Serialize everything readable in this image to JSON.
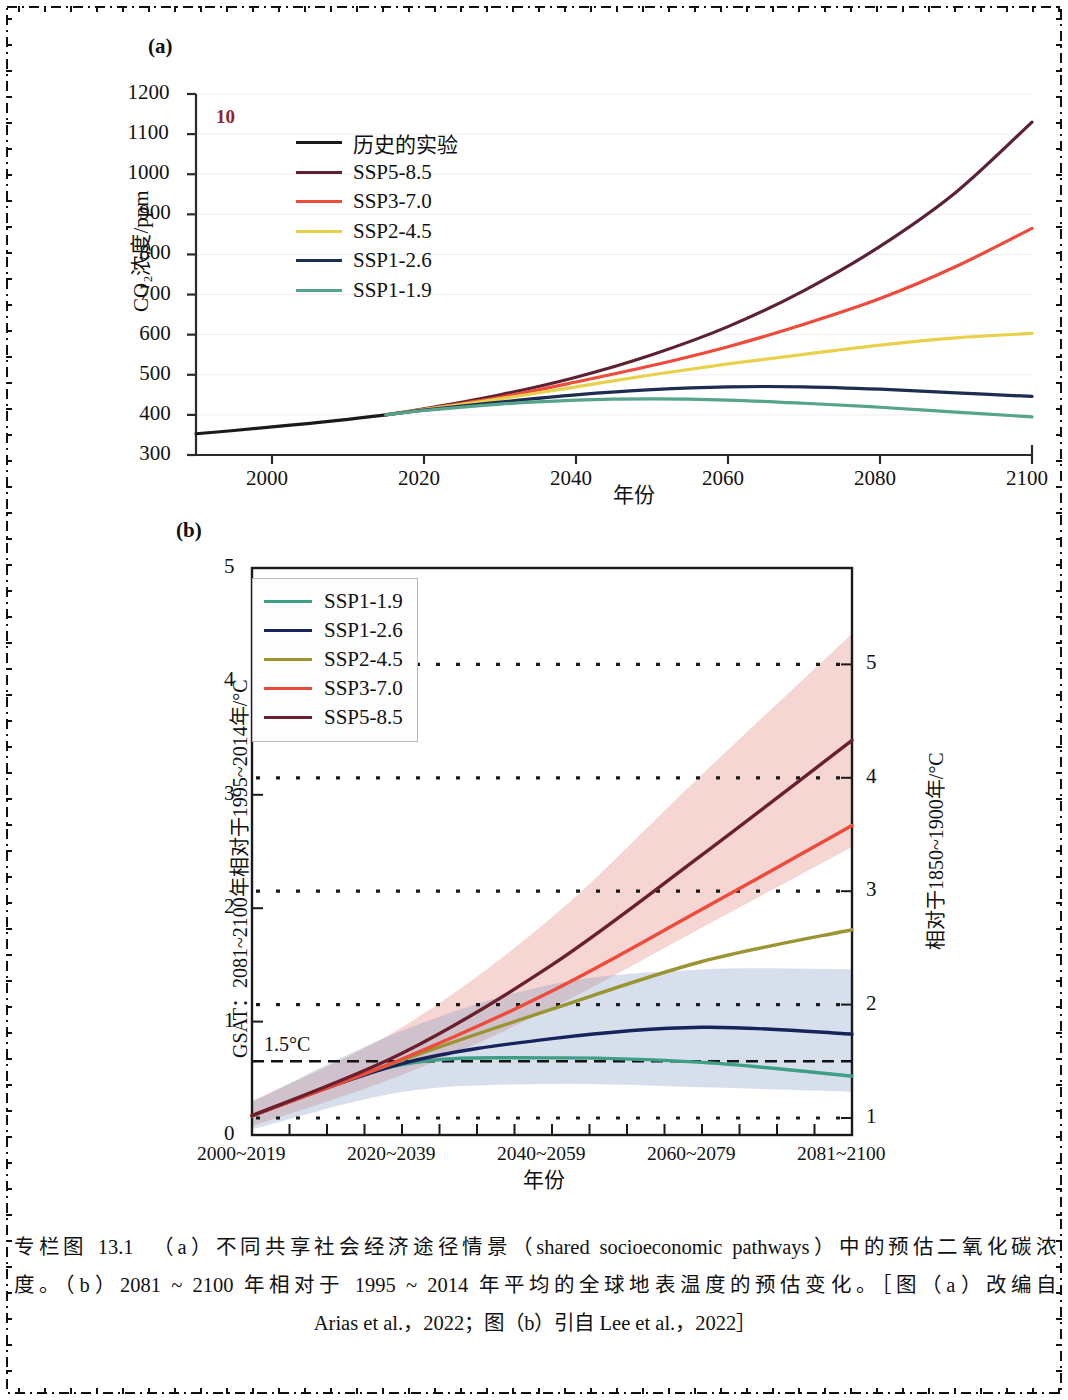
{
  "page": {
    "number": "10",
    "number_color": "#8e2231",
    "frame_style": "dash-dot-cross"
  },
  "panels": [
    {
      "letter": "(a)",
      "ylabel": "CO₂浓度/ppm",
      "xlabel": "年份",
      "legend": [
        {
          "label": "历史的实验",
          "color": "#1a1a1a"
        },
        {
          "label": "SSP5-8.5",
          "color": "#5c2232"
        },
        {
          "label": "SSP3-7.0",
          "color": "#ee4b3a"
        },
        {
          "label": "SSP2-4.5",
          "color": "#e8d14a"
        },
        {
          "label": "SSP1-2.6",
          "color": "#1d2d52"
        },
        {
          "label": "SSP1-1.9",
          "color": "#56a48c"
        }
      ]
    },
    {
      "letter": "(b)",
      "ylabel_left": "GSAT：2081~2100年相对于1995~2014年/°C",
      "ylabel_right": "相对于1850~1900年/°C",
      "xlabel": "年份",
      "threshold_label": "1.5°C",
      "legend": [
        {
          "label": "SSP1-1.9",
          "color": "#3e9e86"
        },
        {
          "label": "SSP1-2.6",
          "color": "#17235a"
        },
        {
          "label": "SSP2-4.5",
          "color": "#9a9432"
        },
        {
          "label": "SSP3-7.0",
          "color": "#ee4b3a"
        },
        {
          "label": "SSP5-8.5",
          "color": "#6b1f2e"
        }
      ]
    }
  ],
  "chart_data": [
    {
      "type": "line",
      "panel": "a",
      "title": "(a)",
      "xlabel": "年份",
      "ylabel": "CO₂浓度/ppm",
      "xlim": [
        1990,
        2100
      ],
      "ylim": [
        300,
        1200
      ],
      "xticks": [
        2000,
        2020,
        2040,
        2060,
        2080,
        2100
      ],
      "yticks": [
        300,
        400,
        500,
        600,
        700,
        800,
        900,
        1000,
        1100,
        1200
      ],
      "grid": false,
      "legend_position": "upper-left-inside",
      "x": [
        1990,
        2000,
        2010,
        2015,
        2020,
        2030,
        2040,
        2050,
        2060,
        2070,
        2080,
        2090,
        2100
      ],
      "series": [
        {
          "name": "历史的实验",
          "color": "#1a1a1a",
          "x": [
            1990,
            1995,
            2000,
            2005,
            2010,
            2015
          ],
          "values": [
            353,
            361,
            370,
            379,
            389,
            400
          ]
        },
        {
          "name": "SSP5-8.5",
          "color": "#5c2232",
          "values": [
            null,
            null,
            null,
            400,
            415,
            450,
            494,
            550,
            620,
            710,
            820,
            955,
            1130
          ]
        },
        {
          "name": "SSP3-7.0",
          "color": "#ee4b3a",
          "values": [
            null,
            null,
            null,
            400,
            414,
            444,
            482,
            523,
            570,
            626,
            690,
            770,
            865
          ]
        },
        {
          "name": "SSP2-4.5",
          "color": "#e8d14a",
          "values": [
            null,
            null,
            null,
            400,
            413,
            440,
            470,
            500,
            527,
            551,
            574,
            592,
            603
          ]
        },
        {
          "name": "SSP1-2.6",
          "color": "#1d2d52",
          "values": [
            null,
            null,
            null,
            400,
            412,
            432,
            450,
            463,
            470,
            470,
            464,
            455,
            446
          ]
        },
        {
          "name": "SSP1-1.9",
          "color": "#56a48c",
          "values": [
            null,
            null,
            null,
            400,
            411,
            427,
            437,
            440,
            437,
            429,
            419,
            407,
            395
          ]
        }
      ]
    },
    {
      "type": "line",
      "panel": "b",
      "title": "(b)",
      "xlabel": "年份",
      "ylabel_left": "GSAT：2081~2100年相对于1995~2014年/°C",
      "ylabel_right": "相对于1850~1900年/°C",
      "xticklabels": [
        "2000~2019",
        "2020~2039",
        "2040~2059",
        "2060~2079",
        "2081~2100"
      ],
      "ylim_left": [
        0,
        5
      ],
      "yticks_left": [
        0,
        1,
        2,
        3,
        4,
        5
      ],
      "ylim_right": [
        0.85,
        5.85
      ],
      "yticks_right": [
        1,
        2,
        3,
        4,
        5
      ],
      "right_axis_offset": 0.85,
      "grid": "dotted-horizontal",
      "legend_position": "upper-left-inside",
      "threshold": {
        "label": "1.5°C",
        "value": 0.65,
        "style": "dashed"
      },
      "x": [
        2009.5,
        2029.5,
        2049.5,
        2069.5,
        2090.5
      ],
      "series": [
        {
          "name": "SSP1-1.9",
          "color": "#3e9e86",
          "values": [
            0.17,
            0.62,
            0.68,
            0.64,
            0.52
          ]
        },
        {
          "name": "SSP1-2.6",
          "color": "#17235a",
          "values": [
            0.17,
            0.63,
            0.85,
            0.95,
            0.89
          ],
          "band_low": [
            0.05,
            0.38,
            0.45,
            0.42,
            0.38
          ],
          "band_high": [
            0.29,
            0.92,
            1.33,
            1.46,
            1.46
          ]
        },
        {
          "name": "SSP2-4.5",
          "color": "#9a9432",
          "values": [
            0.17,
            0.66,
            1.11,
            1.53,
            1.81
          ]
        },
        {
          "name": "SSP3-7.0",
          "color": "#ee4b3a",
          "values": [
            0.17,
            0.67,
            1.27,
            1.99,
            2.73
          ]
        },
        {
          "name": "SSP5-8.5",
          "color": "#6b1f2e",
          "values": [
            0.17,
            0.72,
            1.5,
            2.47,
            3.48
          ],
          "band_low": [
            0.08,
            0.53,
            1.12,
            1.83,
            2.54
          ],
          "band_high": [
            0.3,
            0.95,
            1.92,
            3.18,
            4.42
          ]
        }
      ]
    }
  ],
  "caption": {
    "line1": "专栏图 13.1　（a）不同共享社会经济途径情景（shared socioeconomic pathways）中的预估二氧化碳浓",
    "line2": "度。（b）2081 ~ 2100 年相对于 1995 ~ 2014 年平均的全球地表温度的预估变化。［图（a）改编自",
    "line3": "Arias et al.，2022；图（b）引自 Lee et al.，2022］"
  }
}
